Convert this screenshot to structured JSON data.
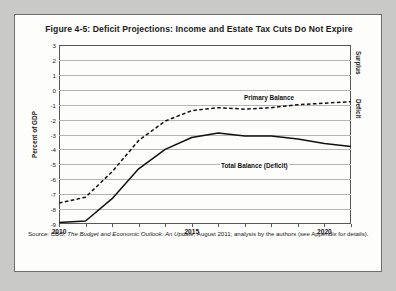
{
  "figure": {
    "title": "Figure 4-5: Deficit Projections: Income and Estate Tax Cuts Do Not Expire",
    "source_prefix": "Source: CBO, ",
    "source_italic": "The Budget and Economic Outlook: An Update",
    "source_suffix": ", August 2011; analysis by the authors (see Appendix for details)."
  },
  "side_labels": {
    "surplus": "Surplus",
    "deficit": "Deficit"
  },
  "chart_data": {
    "type": "line",
    "title": "Figure 4-5: Deficit Projections: Income and Estate Tax Cuts Do Not Expire",
    "xlabel": "",
    "ylabel": "Percent of GDP",
    "xlim": [
      2010,
      2021
    ],
    "ylim": [
      -9,
      3
    ],
    "yticks": [
      3,
      2,
      1,
      0,
      -1,
      -2,
      -3,
      -4,
      -5,
      -6,
      -7,
      -8,
      -9
    ],
    "ytick_labels": [
      "3",
      "2",
      "1",
      "0",
      "-1",
      "-2",
      "-3",
      "-4",
      "-5",
      "-6",
      "-7",
      "-8",
      "-9"
    ],
    "xticks": [
      2010,
      2011,
      2012,
      2013,
      2014,
      2015,
      2016,
      2017,
      2018,
      2019,
      2020,
      2021
    ],
    "xtick_labels": [
      "2010",
      "",
      "",
      "",
      "",
      "2015",
      "",
      "",
      "",
      "",
      "2020",
      ""
    ],
    "grid": true,
    "legend": "annotated-inline",
    "x": [
      2010,
      2011,
      2012,
      2013,
      2014,
      2015,
      2016,
      2017,
      2018,
      2019,
      2020,
      2021
    ],
    "series": [
      {
        "name": "Primary Balance",
        "style": "dashed",
        "color": "#111111",
        "values": [
          -7.6,
          -7.2,
          -5.5,
          -3.4,
          -2.1,
          -1.4,
          -1.2,
          -1.3,
          -1.2,
          -1.0,
          -0.9,
          -0.8
        ]
      },
      {
        "name": "Total Balance (Deficit)",
        "style": "solid",
        "color": "#111111",
        "values": [
          -8.9,
          -8.8,
          -7.3,
          -5.3,
          -4.0,
          -3.2,
          -2.9,
          -3.1,
          -3.1,
          -3.3,
          -3.6,
          -3.8
        ]
      }
    ]
  }
}
